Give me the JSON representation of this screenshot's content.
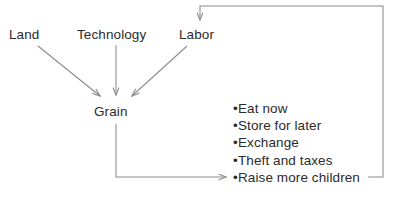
{
  "diagram": {
    "background_color": "#ffffff",
    "line_color": "#8a8a8a",
    "text_color": "#2b2b2b",
    "inputs": [
      {
        "id": "land",
        "label": "Land"
      },
      {
        "id": "technology",
        "label": "Technology"
      },
      {
        "id": "labor",
        "label": "Labor"
      }
    ],
    "process": {
      "id": "grain",
      "label": "Grain"
    },
    "outcomes": {
      "bullet_char": "•",
      "items": [
        {
          "label": "Eat now"
        },
        {
          "label": "Store for later"
        },
        {
          "label": "Exchange"
        },
        {
          "label": "Theft and taxes"
        },
        {
          "label": "Raise more children"
        }
      ]
    },
    "connections": [
      {
        "id": "land-to-grain",
        "from": "Land",
        "to": "Grain",
        "style": "arrow-diagonal"
      },
      {
        "id": "technology-to-grain",
        "from": "Technology",
        "to": "Grain",
        "style": "arrow-vertical"
      },
      {
        "id": "labor-to-grain",
        "from": "Labor",
        "to": "Grain",
        "style": "arrow-diagonal"
      },
      {
        "id": "grain-to-outcomes",
        "from": "Grain",
        "to": "Raise more children",
        "style": "arrow-elbow"
      },
      {
        "id": "children-to-labor",
        "from": "Raise more children",
        "to": "Labor",
        "style": "feedback-loop"
      }
    ]
  }
}
